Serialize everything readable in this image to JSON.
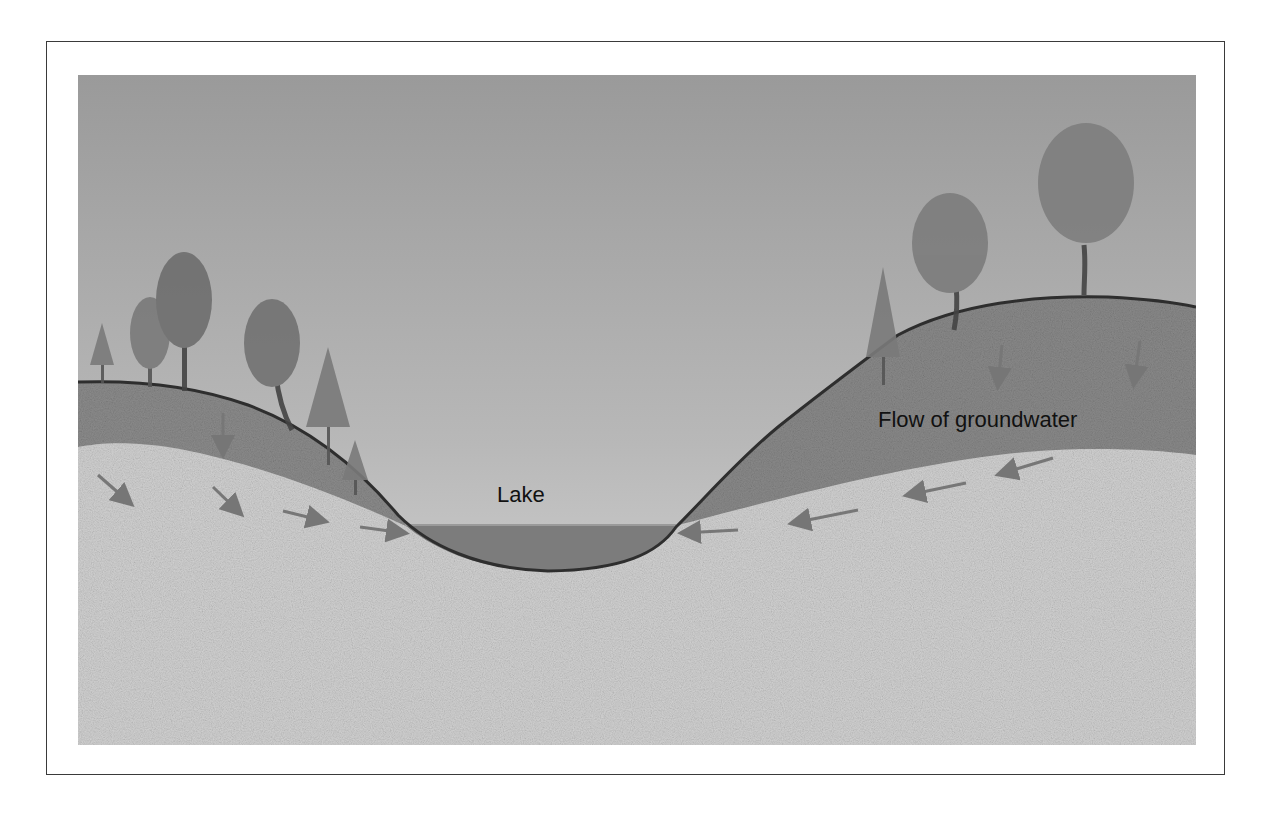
{
  "diagram": {
    "type": "cross-section illustration",
    "labels": {
      "lake": "Lake",
      "flow": "Flow of groundwater"
    },
    "elements": [
      {
        "name": "sky",
        "description": "grey gradient sky background"
      },
      {
        "name": "left-hill",
        "description": "darker upper soil layer on left hill with deciduous and conifer trees"
      },
      {
        "name": "right-hill",
        "description": "darker upper soil layer on right hill with trees"
      },
      {
        "name": "lake",
        "description": "water filling the valley basin"
      },
      {
        "name": "lower-aquifer",
        "description": "light speckled permeable ground layer"
      },
      {
        "name": "flow-arrows",
        "description": "arrows pointing down-slope toward lake on both sides"
      }
    ],
    "colors": {
      "sky_top": "#9a9a9a",
      "sky_bottom": "#d6d6d6",
      "upper_soil": "#8a8a8a",
      "lower_soil": "#cfcfcf",
      "lake": "#7c7c7c",
      "outline": "#2e2e2e",
      "arrow": "#7a7a7a",
      "frame": "#3a3a3a"
    }
  }
}
